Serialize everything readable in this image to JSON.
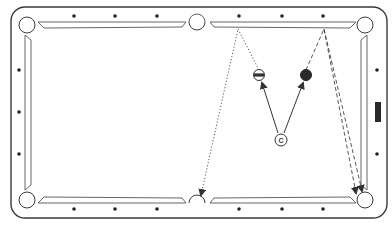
{
  "diagram": {
    "type": "pool-table-shot-diagram",
    "colors": {
      "line": "#3a3a3a",
      "background": "#ffffff",
      "ball_solid": "#2a2a2a",
      "diamond": "#222222",
      "marker": "#333333"
    },
    "cue_ball": {
      "label": "C",
      "x": 281,
      "y": 140
    },
    "object_balls": [
      {
        "name": "striped-ball",
        "style": "stripe",
        "x": 259,
        "y": 75
      },
      {
        "name": "solid-ball",
        "style": "solid",
        "x": 306,
        "y": 75
      }
    ],
    "shots": [
      {
        "name": "cue-to-stripe",
        "style": "solid-arrow",
        "from": [
          278,
          133
        ],
        "to": [
          262,
          83
        ]
      },
      {
        "name": "cue-to-solid",
        "style": "solid-arrow",
        "from": [
          284,
          133
        ],
        "to": [
          303,
          83
        ]
      }
    ],
    "paths": [
      {
        "name": "stripe-rail-path-left",
        "style": "dotted",
        "points": [
          [
            259,
            70
          ],
          [
            238,
            29
          ],
          [
            201,
            195
          ]
        ]
      },
      {
        "name": "solid-rail-path-right",
        "style": "dashed",
        "points": [
          [
            306,
            70
          ],
          [
            324,
            29
          ],
          [
            356,
            193
          ]
        ]
      },
      {
        "name": "solid-rail-path-right-2",
        "style": "dashed",
        "points": [
          [
            324,
            29
          ],
          [
            362,
            191
          ]
        ]
      }
    ],
    "diamonds": {
      "top": [
        [
          74,
          16
        ],
        [
          115,
          16
        ],
        [
          157,
          16
        ],
        [
          239,
          16
        ],
        [
          282,
          16
        ],
        [
          323,
          16
        ]
      ],
      "bottom": [
        [
          74,
          209
        ],
        [
          115,
          209
        ],
        [
          157,
          209
        ],
        [
          239,
          209
        ],
        [
          282,
          209
        ],
        [
          323,
          209
        ]
      ],
      "left": [
        [
          19,
          70
        ],
        [
          19,
          112
        ],
        [
          19,
          154
        ]
      ],
      "right": [
        [
          377,
          70
        ],
        [
          377,
          154
        ]
      ]
    },
    "rail_marker": {
      "name": "rail-marker",
      "x": 375,
      "y": 102,
      "w": 6,
      "h": 20
    }
  }
}
